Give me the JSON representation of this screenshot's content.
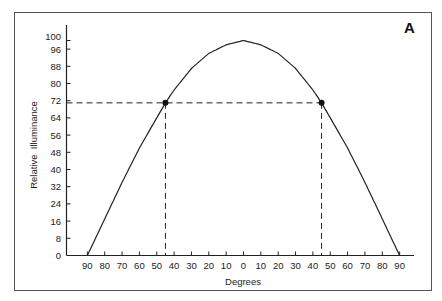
{
  "chart_data": {
    "type": "line",
    "title": "",
    "panel_label": "A",
    "xlabel": "Degrees",
    "ylabel": "Relative  Illuminance",
    "x_tick_labels": [
      "90",
      "80",
      "70",
      "60",
      "50",
      "40",
      "30",
      "20",
      "10",
      "0",
      "10",
      "20",
      "30",
      "40",
      "50",
      "60",
      "70",
      "80",
      "90"
    ],
    "x_tick_values": [
      -90,
      -80,
      -70,
      -60,
      -50,
      -40,
      -30,
      -20,
      -10,
      0,
      10,
      20,
      30,
      40,
      50,
      60,
      70,
      80,
      90
    ],
    "y_tick_labels": [
      "0",
      "8",
      "16",
      "24",
      "32",
      "40",
      "48",
      "56",
      "64",
      "72",
      "80",
      "88",
      "96",
      "100"
    ],
    "y_tick_values": [
      0,
      8,
      16,
      24,
      32,
      40,
      48,
      56,
      64,
      72,
      80,
      88,
      96,
      100
    ],
    "xlim": [
      -90,
      90
    ],
    "ylim": [
      0,
      100
    ],
    "grid": false,
    "series": [
      {
        "name": "Relative Illuminance",
        "x": [
          -90,
          -80,
          -70,
          -60,
          -50,
          -45,
          -40,
          -30,
          -20,
          -10,
          0,
          10,
          20,
          30,
          40,
          45,
          50,
          60,
          70,
          80,
          90
        ],
        "y": [
          0,
          17,
          34,
          50,
          64,
          71,
          77,
          87,
          94,
          98,
          100,
          98,
          94,
          87,
          77,
          71,
          64,
          50,
          34,
          17,
          0
        ]
      }
    ],
    "annotations": [
      {
        "type": "point",
        "x": -45,
        "y": 71
      },
      {
        "type": "point",
        "x": 45,
        "y": 71
      },
      {
        "type": "dashed-hline",
        "y": 71,
        "x_from": -90,
        "x_to": 45
      },
      {
        "type": "dashed-vline",
        "x": -45,
        "y_from": 0,
        "y_to": 71
      },
      {
        "type": "dashed-vline",
        "x": 45,
        "y_from": 0,
        "y_to": 71
      }
    ]
  }
}
